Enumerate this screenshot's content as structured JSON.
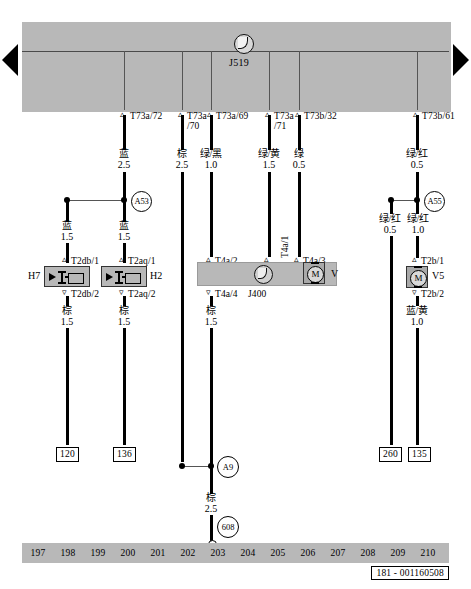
{
  "diagram": {
    "id_label": "181 - 001160508",
    "control_unit": {
      "name": "J519",
      "symbol": "control-unit-icon"
    },
    "terminals_top": [
      {
        "id": "T73a/72",
        "color": "蓝",
        "gauge": "2.5"
      },
      {
        "id": "T73a",
        "id2": "/70",
        "color": "棕",
        "gauge": "2.5"
      },
      {
        "id": "T73a/69",
        "color": "绿/黑",
        "gauge": "1.0"
      },
      {
        "id": "T73a",
        "id2": "/71",
        "color": "绿/黄",
        "gauge": "1.5"
      },
      {
        "id": "T73b/32",
        "color": "绿",
        "gauge": "0.5"
      },
      {
        "id": "T73b/61",
        "color": "绿/红",
        "gauge": "0.5"
      }
    ],
    "splices": [
      {
        "name": "A53"
      },
      {
        "name": "A55"
      },
      {
        "name": "A9"
      },
      {
        "name": "608"
      }
    ],
    "branch_wires": [
      {
        "color": "蓝",
        "gauge": "1.5"
      },
      {
        "color": "蓝",
        "gauge": "1.5"
      },
      {
        "color": "绿/红",
        "gauge": "0.5"
      },
      {
        "color": "绿/红",
        "gauge": "1.0"
      }
    ],
    "components": [
      {
        "name": "H7",
        "type": "horn",
        "terminal_top": "T2db/1",
        "terminal_bottom": "T2db/2",
        "wire_out": {
          "color": "棕",
          "gauge": "1.5"
        },
        "ground_ref": "120"
      },
      {
        "name": "H2",
        "type": "horn",
        "terminal_top": "T2aq/1",
        "terminal_bottom": "T2aq/2",
        "wire_out": {
          "color": "棕",
          "gauge": "1.5"
        },
        "ground_ref": "136"
      },
      {
        "name": "J400",
        "type": "wiper-motor-module",
        "terminals": [
          "T4a/2",
          "T4a/1",
          "T4a/3",
          "T4a/4"
        ],
        "motor_label": "V",
        "wire_out": {
          "color": "棕",
          "gauge": "1.5"
        }
      },
      {
        "name": "V5",
        "type": "motor",
        "terminal_top": "T2b/1",
        "terminal_bottom": "T2b/2",
        "wire_out": {
          "color": "蓝/黄",
          "gauge": "1.0"
        },
        "ground_ref": "135"
      }
    ],
    "ground_refs": [
      "120",
      "136",
      "260",
      "135"
    ],
    "ground_wire": {
      "color": "棕",
      "gauge": "2.5"
    },
    "track_numbers": [
      "197",
      "198",
      "199",
      "200",
      "201",
      "202",
      "203",
      "204",
      "205",
      "206",
      "207",
      "208",
      "209",
      "210"
    ]
  }
}
